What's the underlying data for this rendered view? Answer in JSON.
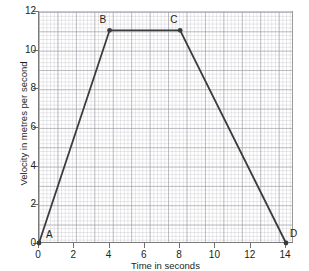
{
  "chart_data": {
    "type": "line",
    "title": "",
    "xlabel": "Time in seconds",
    "ylabel": "Velocity in metres per second",
    "xlim": [
      0,
      14
    ],
    "ylim": [
      0,
      12
    ],
    "xticks": [
      "0",
      "2",
      "4",
      "6",
      "8",
      "10",
      "12",
      "14"
    ],
    "yticks": [
      "0",
      "2",
      "4",
      "6",
      "8",
      "10",
      "12"
    ],
    "grid": true,
    "legend": "none",
    "line_color": "#3b3b3b",
    "series": [
      {
        "name": "velocity",
        "x": [
          0,
          4,
          8,
          14
        ],
        "y": [
          0,
          11,
          11,
          0
        ]
      }
    ],
    "points": [
      {
        "label": "A",
        "x": 0,
        "y": 0,
        "label_dx": 7,
        "label_dy": -13
      },
      {
        "label": "B",
        "x": 4,
        "y": 11,
        "label_dx": -10,
        "label_dy": -15
      },
      {
        "label": "C",
        "x": 8,
        "y": 11,
        "label_dx": -10,
        "label_dy": -15
      },
      {
        "label": "D",
        "x": 14,
        "y": 0,
        "label_dx": 4,
        "label_dy": -14
      }
    ],
    "annotations": []
  }
}
